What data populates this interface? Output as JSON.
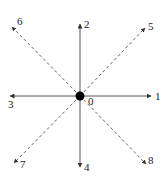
{
  "diagram": {
    "title": "",
    "center": {
      "label": "0",
      "x": 80,
      "y": 96
    },
    "directions": [
      {
        "id": "1",
        "label": "1",
        "style": "solid",
        "end": [
          151,
          96
        ],
        "label_pos": [
          155,
          100
        ]
      },
      {
        "id": "2",
        "label": "2",
        "style": "solid",
        "end": [
          80,
          24
        ],
        "label_pos": [
          84,
          28
        ]
      },
      {
        "id": "3",
        "label": "3",
        "style": "solid",
        "end": [
          10,
          96
        ],
        "label_pos": [
          8,
          108
        ]
      },
      {
        "id": "4",
        "label": "4",
        "style": "solid",
        "end": [
          80,
          167
        ],
        "label_pos": [
          84,
          171
        ]
      },
      {
        "id": "5",
        "label": "5",
        "style": "dashed",
        "end": [
          145,
          28
        ],
        "label_pos": [
          148,
          30
        ]
      },
      {
        "id": "6",
        "label": "6",
        "style": "dashed",
        "end": [
          12,
          27
        ],
        "label_pos": [
          17,
          25
        ]
      },
      {
        "id": "7",
        "label": "7",
        "style": "dashed",
        "end": [
          14,
          163
        ],
        "label_pos": [
          20,
          168
        ]
      },
      {
        "id": "8",
        "label": "8",
        "style": "dashed",
        "end": [
          146,
          164
        ],
        "label_pos": [
          148,
          164
        ]
      }
    ],
    "colors": {
      "line": "#555555",
      "dot": "#000000",
      "text": "#222222"
    }
  }
}
